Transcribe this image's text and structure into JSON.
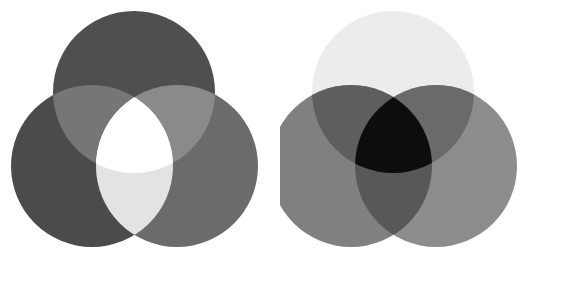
{
  "figure": {
    "width": 561,
    "height": 281,
    "background": "#ffffff",
    "panel_count": 2
  },
  "chart_data": {
    "type": "diagram",
    "subtype": "venn-three-circle-colour-mixing",
    "xlabel": "",
    "ylabel": "",
    "grid": false,
    "legend_position": "none",
    "panels": [
      {
        "id": "additive",
        "name": "Additive colour mixing",
        "origin_x": 0,
        "origin_y": 0,
        "width": 280,
        "height": 281,
        "radius": 81,
        "circles": [
          {
            "id": "top",
            "label": "Top circle",
            "cx": 134,
            "cy": 92,
            "r": 81,
            "fill": "#4f4f4f"
          },
          {
            "id": "left",
            "label": "Lower-left circle",
            "cx": 92,
            "cy": 166,
            "r": 81,
            "fill": "#4b4b4b"
          },
          {
            "id": "right",
            "label": "Lower-right circle",
            "cx": 177,
            "cy": 166,
            "r": 81,
            "fill": "#6b6b6b"
          }
        ],
        "regions": [
          {
            "id": "top_only",
            "label": "Top only",
            "fill": "#4f4f4f"
          },
          {
            "id": "left_only",
            "label": "Lower-left only",
            "fill": "#4b4b4b"
          },
          {
            "id": "right_only",
            "label": "Lower-right only",
            "fill": "#6b6b6b"
          },
          {
            "id": "top_left",
            "label": "Top + lower-left overlap",
            "fill": "#767676"
          },
          {
            "id": "top_right",
            "label": "Top + lower-right overlap",
            "fill": "#8a8a8a"
          },
          {
            "id": "left_right",
            "label": "Lower-left + lower-right overlap",
            "fill": "#e3e3e3"
          },
          {
            "id": "center",
            "label": "All three overlap (white)",
            "fill": "#ffffff"
          }
        ]
      },
      {
        "id": "subtractive",
        "name": "Subtractive colour mixing",
        "origin_x": 280,
        "origin_y": 0,
        "width": 281,
        "height": 281,
        "radius": 81,
        "circles": [
          {
            "id": "top",
            "label": "Top circle",
            "cx": 113,
            "cy": 92,
            "r": 81,
            "fill": "#ececec"
          },
          {
            "id": "left",
            "label": "Lower-left circle",
            "cx": 71,
            "cy": 166,
            "r": 81,
            "fill": "#808080"
          },
          {
            "id": "right",
            "label": "Lower-right circle",
            "cx": 156,
            "cy": 166,
            "r": 81,
            "fill": "#8d8d8d"
          }
        ],
        "regions": [
          {
            "id": "top_only",
            "label": "Top only",
            "fill": "#ececec"
          },
          {
            "id": "left_only",
            "label": "Lower-left only",
            "fill": "#808080"
          },
          {
            "id": "right_only",
            "label": "Lower-right only",
            "fill": "#8d8d8d"
          },
          {
            "id": "top_left",
            "label": "Top + lower-left overlap",
            "fill": "#5e5e5e"
          },
          {
            "id": "top_right",
            "label": "Top + lower-right overlap",
            "fill": "#6a6a6a"
          },
          {
            "id": "left_right",
            "label": "Lower-left + lower-right overlap",
            "fill": "#585858"
          },
          {
            "id": "center",
            "label": "All three overlap (black)",
            "fill": "#0d0d0d"
          }
        ]
      }
    ]
  }
}
